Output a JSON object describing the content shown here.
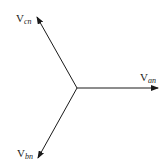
{
  "diagram": {
    "origin": {
      "x": 77,
      "y": 88
    },
    "line_color": "#1a1a1a",
    "phasors": [
      {
        "id": "van",
        "base": "V",
        "subscript": "an",
        "tip": {
          "x": 158,
          "y": 88
        },
        "label_pos": {
          "x": 140,
          "y": 81
        }
      },
      {
        "id": "vbn",
        "base": "V",
        "subscript": "bn",
        "tip": {
          "x": 38,
          "y": 158
        },
        "label_pos": {
          "x": 17,
          "y": 159
        }
      },
      {
        "id": "vcn",
        "base": "V",
        "subscript": "cn",
        "tip": {
          "x": 37,
          "y": 17
        },
        "label_pos": {
          "x": 16,
          "y": 24
        }
      }
    ]
  }
}
